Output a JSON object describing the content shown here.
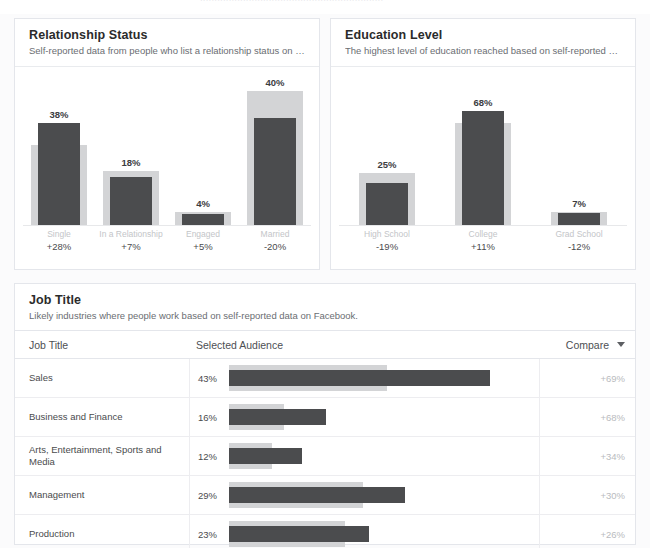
{
  "top_strip": {
    "ghost_text": "································································"
  },
  "cards": {
    "relationship": {
      "title": "Relationship Status",
      "subtitle": "Self-reported data from people who list a relationship status on F..."
    },
    "education": {
      "title": "Education Level",
      "subtitle": "The highest level of education reached based on self-reported da..."
    },
    "job": {
      "title": "Job Title",
      "subtitle": "Likely industries where people work based on self-reported data on Facebook."
    }
  },
  "table": {
    "columns": {
      "job_title": "Job Title",
      "selected_audience": "Selected Audience",
      "compare": "Compare"
    },
    "sort_icon": "chevron-down-icon"
  },
  "colors": {
    "bar_main": "#4b4c4e",
    "bar_compare": "#d3d4d6",
    "card_border": "#e4e6eb",
    "title_text": "#2b2b2b",
    "muted_text": "#b9bbbe"
  },
  "chart_data": [
    {
      "type": "bar",
      "title": "Relationship Status",
      "subtitle": "Self-reported data from people who list a relationship status on F...",
      "xlabel": "",
      "ylabel": "",
      "ylim": [
        0,
        50
      ],
      "grid": false,
      "legend": "none",
      "orientation": "vertical",
      "categories": [
        "Single",
        "In a Relationship",
        "Engaged",
        "Married"
      ],
      "value_labels": [
        "38%",
        "18%",
        "4%",
        "40%"
      ],
      "delta_labels": [
        "+28%",
        "+7%",
        "+5%",
        "-20%"
      ],
      "series": [
        {
          "name": "Selected Audience",
          "values": [
            38,
            18,
            4,
            40
          ]
        },
        {
          "name": "Compare",
          "values": [
            30,
            20,
            5,
            50
          ]
        }
      ]
    },
    {
      "type": "bar",
      "title": "Education Level",
      "subtitle": "The highest level of education reached based on self-reported da...",
      "xlabel": "",
      "ylabel": "",
      "ylim": [
        0,
        80
      ],
      "grid": false,
      "legend": "none",
      "orientation": "vertical",
      "categories": [
        "High School",
        "College",
        "Grad School"
      ],
      "value_labels": [
        "25%",
        "68%",
        "7%"
      ],
      "delta_labels": [
        "-19%",
        "+11%",
        "-12%"
      ],
      "series": [
        {
          "name": "Selected Audience",
          "values": [
            25,
            68,
            7
          ]
        },
        {
          "name": "Compare",
          "values": [
            31,
            61,
            8
          ]
        }
      ]
    },
    {
      "type": "bar",
      "title": "Job Title",
      "subtitle": "Likely industries where people work based on self-reported data on Facebook.",
      "orientation": "horizontal",
      "xlabel": "Selected Audience",
      "ylabel": "Job Title",
      "xlim": [
        0,
        50
      ],
      "grid": false,
      "legend": "none",
      "categories": [
        "Sales",
        "Business and Finance",
        "Arts, Entertainment, Sports and Media",
        "Management",
        "Production"
      ],
      "value_labels": [
        "43%",
        "16%",
        "12%",
        "29%",
        "23%"
      ],
      "compare_labels": [
        "+69%",
        "+68%",
        "+34%",
        "+30%",
        "+26%"
      ],
      "series": [
        {
          "name": "Selected Audience",
          "values": [
            43,
            16,
            12,
            29,
            23
          ]
        },
        {
          "name": "Compare",
          "values": [
            26,
            9,
            7,
            22,
            19
          ]
        }
      ]
    }
  ],
  "rows": [
    {
      "job_title": "Sales",
      "pct": "43%",
      "main": 43,
      "cmp": 26,
      "compare": "+69%"
    },
    {
      "job_title": "Business and Finance",
      "pct": "16%",
      "main": 16,
      "cmp": 9,
      "compare": "+68%"
    },
    {
      "job_title": "Arts, Entertainment, Sports and Media",
      "pct": "12%",
      "main": 12,
      "cmp": 7,
      "compare": "+34%"
    },
    {
      "job_title": "Management",
      "pct": "29%",
      "main": 29,
      "cmp": 22,
      "compare": "+30%"
    },
    {
      "job_title": "Production",
      "pct": "23%",
      "main": 23,
      "cmp": 19,
      "compare": "+26%"
    }
  ]
}
